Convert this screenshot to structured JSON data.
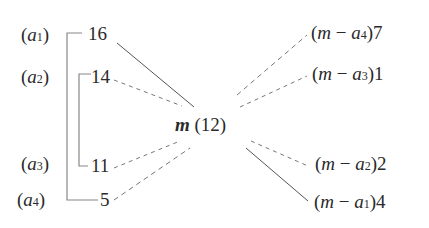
{
  "left": {
    "labels": [
      {
        "name": "a",
        "sub": "1"
      },
      {
        "name": "a",
        "sub": "2"
      },
      {
        "name": "a",
        "sub": "3"
      },
      {
        "name": "a",
        "sub": "4"
      }
    ],
    "values": [
      "16",
      "14",
      "11",
      "5"
    ]
  },
  "center": {
    "symbol": "m",
    "value": "(12)"
  },
  "right": {
    "items": [
      {
        "m": "m",
        "minus": "−",
        "a": "a",
        "sub": "4",
        "value": "7"
      },
      {
        "m": "m",
        "minus": "−",
        "a": "a",
        "sub": "3",
        "value": "1"
      },
      {
        "m": "m",
        "minus": "−",
        "a": "a",
        "sub": "2",
        "value": "2"
      },
      {
        "m": "m",
        "minus": "−",
        "a": "a",
        "sub": "1",
        "value": "4"
      }
    ]
  },
  "colors": {
    "text": "#2a2a2a",
    "line": "#555555",
    "dashed": "#777777"
  }
}
